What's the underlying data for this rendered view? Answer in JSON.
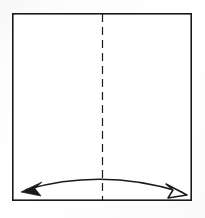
{
  "figure": {
    "type": "origami-instruction-diagram",
    "title": "",
    "background_color": "#fbfbfb",
    "ink_color": "#1a1a1a",
    "paper_fill": "#ffffff"
  },
  "paper": {
    "shape": "square",
    "x": 12,
    "y": 13,
    "width": 180,
    "height": 188,
    "stroke_color": "#1a1a1a",
    "stroke_width": 1.6,
    "fill": "#ffffff"
  },
  "crease": {
    "label": "vertical center crease",
    "line_style": "dashed",
    "x": 102.5,
    "y_start": 14,
    "y_end": 200,
    "dash_length": 8,
    "gap_length": 5,
    "stroke_color": "#1a1a1a",
    "stroke_width": 1.2
  },
  "arrow": {
    "label": "fold-and-unfold arc arrow",
    "path": "M 24,190 Q 103,168 184,192",
    "stroke_color": "#1a1a1a",
    "stroke_width": 1.5,
    "start_head": {
      "name": "solid-arrowhead",
      "style": "filled",
      "fill": "#1a1a1a",
      "tip_x": 21,
      "tip_y": 192,
      "points": "21,192 42,182 35,188.5 41,196"
    },
    "end_head": {
      "name": "hollow-arrowhead",
      "style": "outline",
      "fill": "#ffffff",
      "stroke": "#1a1a1a",
      "tip_x": 187,
      "tip_y": 195,
      "points": "187,195 166,184 173,190 168,198"
    }
  }
}
